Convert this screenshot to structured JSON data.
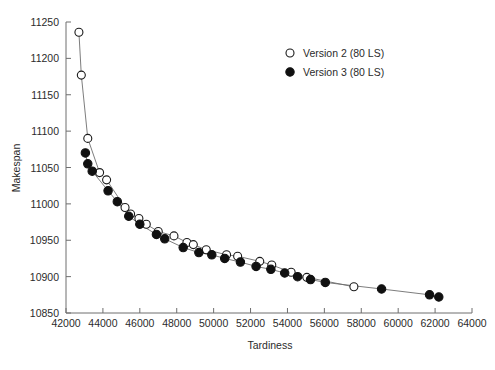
{
  "chart_data": {
    "type": "scatter",
    "title": "",
    "xlabel": "Tardiness",
    "ylabel": "Makespan",
    "xlim": [
      42000,
      64000
    ],
    "ylim": [
      10850,
      11250
    ],
    "xticks": [
      42000,
      44000,
      46000,
      48000,
      50000,
      52000,
      54000,
      56000,
      58000,
      60000,
      62000,
      64000
    ],
    "yticks": [
      10850,
      10900,
      10950,
      11000,
      11050,
      11100,
      11150,
      11200,
      11250
    ],
    "xtick_labels": [
      "42000",
      "44000",
      "46000",
      "48000",
      "50000",
      "52000",
      "54000",
      "56000",
      "58000",
      "60000",
      "62000",
      "64000"
    ],
    "ytick_labels": [
      "10850",
      "10900",
      "10950",
      "11000",
      "11050",
      "11100",
      "11150",
      "11200",
      "11250"
    ],
    "grid": false,
    "legend_position": "top-right",
    "series": [
      {
        "name": "Version 2 (80 LS)",
        "marker": "open-circle",
        "color": "#101010",
        "points": [
          [
            42700,
            11236
          ],
          [
            42830,
            11177
          ],
          [
            43180,
            11090
          ],
          [
            43820,
            11043
          ],
          [
            44200,
            11033
          ],
          [
            45200,
            10995
          ],
          [
            45500,
            10986
          ],
          [
            45950,
            10980
          ],
          [
            46350,
            10972
          ],
          [
            47000,
            10962
          ],
          [
            47850,
            10956
          ],
          [
            48550,
            10947
          ],
          [
            48900,
            10944
          ],
          [
            49600,
            10937
          ],
          [
            50700,
            10930
          ],
          [
            51300,
            10928
          ],
          [
            52500,
            10921
          ],
          [
            53150,
            10916
          ],
          [
            54200,
            10906
          ],
          [
            55050,
            10899
          ],
          [
            57600,
            10886
          ]
        ]
      },
      {
        "name": "Version 3 (80 LS)",
        "marker": "filled-circle",
        "color": "#101010",
        "points": [
          [
            43050,
            11070
          ],
          [
            43180,
            11055
          ],
          [
            43420,
            11045
          ],
          [
            44280,
            11018
          ],
          [
            44780,
            11003
          ],
          [
            45400,
            10983
          ],
          [
            46000,
            10972
          ],
          [
            46900,
            10958
          ],
          [
            47350,
            10952
          ],
          [
            48350,
            10940
          ],
          [
            49200,
            10933
          ],
          [
            49900,
            10930
          ],
          [
            50600,
            10925
          ],
          [
            51450,
            10920
          ],
          [
            52300,
            10914
          ],
          [
            53100,
            10910
          ],
          [
            53850,
            10905
          ],
          [
            54550,
            10900
          ],
          [
            55250,
            10896
          ],
          [
            56050,
            10892
          ],
          [
            59100,
            10883
          ],
          [
            61700,
            10875
          ],
          [
            62200,
            10872
          ]
        ]
      }
    ]
  },
  "legend": {
    "items": [
      {
        "label": "Version 2 (80 LS)",
        "marker": "open-circle"
      },
      {
        "label": "Version 3 (80 LS)",
        "marker": "filled-circle"
      }
    ]
  },
  "axis": {
    "x_title": "Tardiness",
    "y_title": "Makespan"
  }
}
